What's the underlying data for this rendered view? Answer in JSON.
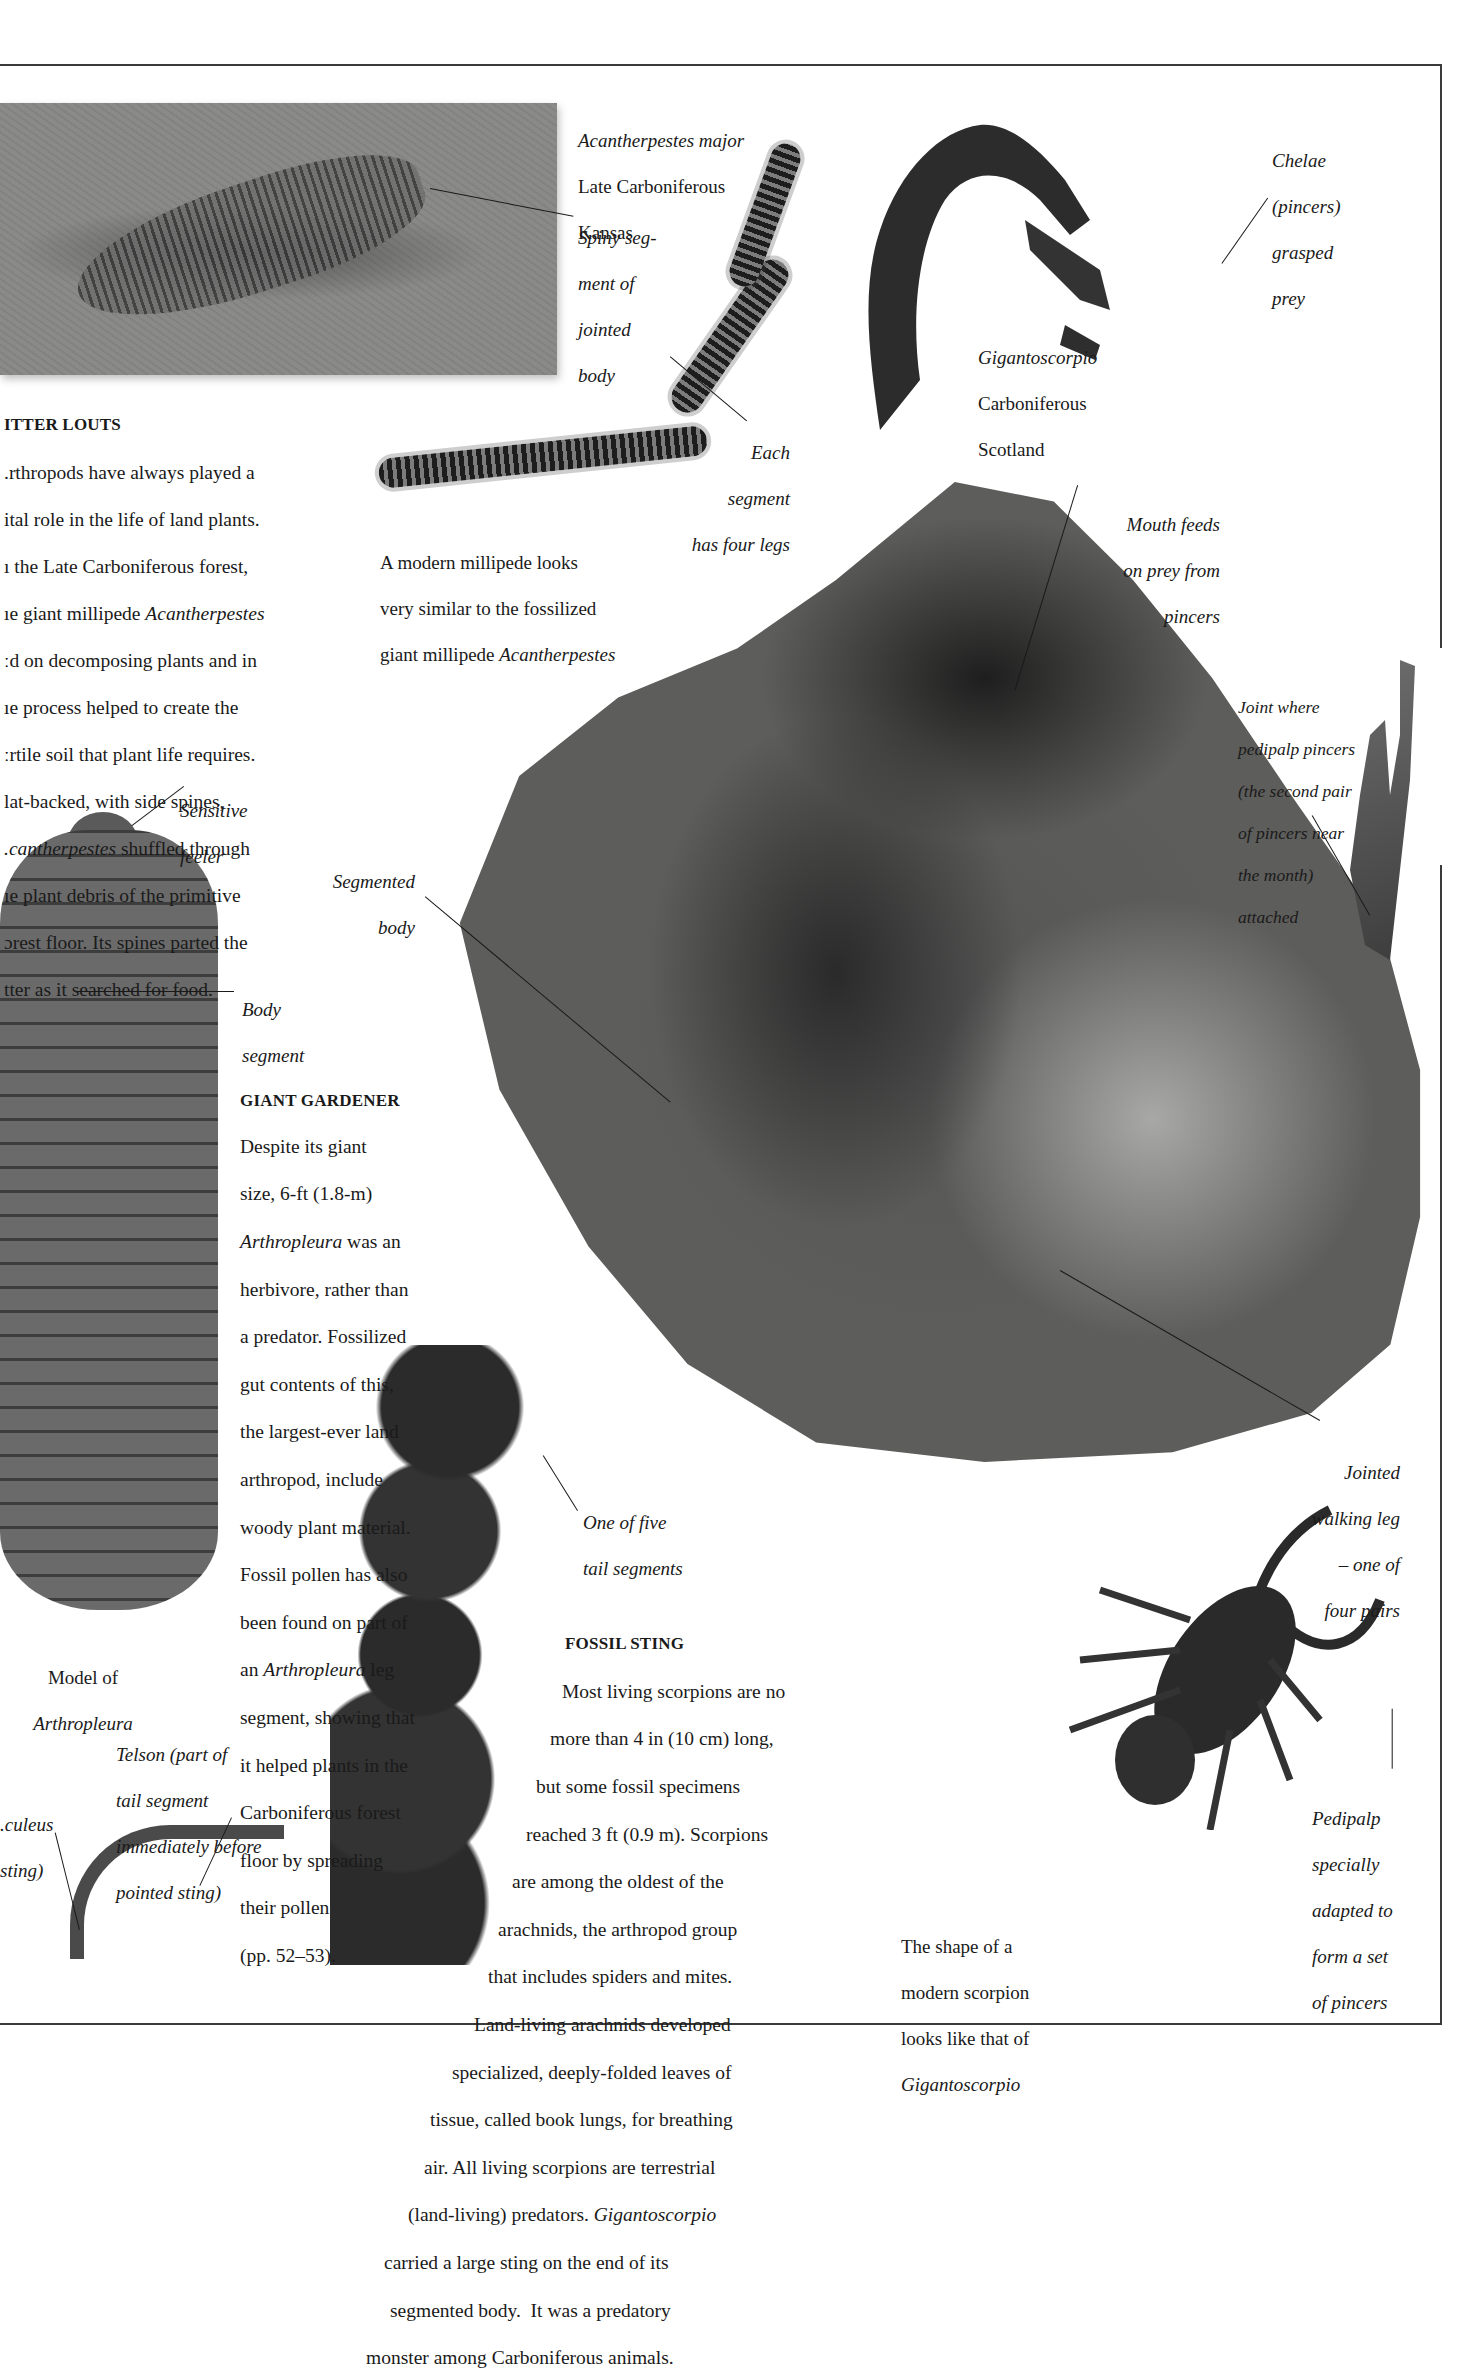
{
  "page": {
    "background": "#ffffff",
    "frame_color": "#3a3a3a"
  },
  "litter_louts": {
    "heading": "ITTER LOUTS",
    "lines": [
      ".rthropods have always played a",
      "ital role in the life of land plants.",
      "ı the Late Carboniferous forest,",
      "ıe giant millipede ",
      "ːd on decomposing plants and in",
      "ıe process helped to create the",
      "ːrtile soil that plant life requires.",
      "lat-backed, with side spines,",
      "",
      "ıe plant debris of the primitive",
      "ɔrest floor. Its spines parted the",
      "tter as it searched for food."
    ],
    "line4_italic": "Acantherpestes",
    "line9_italic": ".cantherpestes",
    "line9_rest": " shuffled through"
  },
  "fossil_millipede_caption": {
    "species": "Acantherpestes major",
    "period": "Late Carboniferous",
    "location": "Kansas"
  },
  "labels": {
    "spiny_segment": [
      "Spiny seg-",
      "ment of",
      "jointed",
      "body"
    ],
    "each_segment": [
      "Each",
      "segment",
      "has four legs"
    ],
    "chelae": [
      "Chelae",
      "(pincers)",
      "grasped",
      "prey"
    ],
    "mouth_feeds": [
      "Mouth feeds",
      "on prey from",
      "pincers"
    ],
    "joint_where": [
      "Joint where",
      "pedipalp pincers",
      "(the second pair",
      "of pincers near",
      "the month)",
      "attached"
    ],
    "sensitive_feeler": [
      "Sensitive",
      "feeler"
    ],
    "segmented_body": [
      "Segmented",
      "body"
    ],
    "body_segment": [
      "Body",
      "segment"
    ],
    "one_of_five": [
      "One of five",
      "tail segments"
    ],
    "jointed_walking_leg": [
      "Jointed",
      "walking leg",
      "– one of",
      "four pairs"
    ],
    "telson": [
      "Telson (part of",
      "tail segment",
      "immediately before",
      "pointed sting)"
    ],
    "aculeus": [
      ".culeus",
      "sting)"
    ],
    "pedipalp": [
      "Pedipalp",
      "specially",
      "adapted to",
      "form a set",
      "of pincers"
    ]
  },
  "scorpion_fossil_caption": {
    "species": "Gigantoscorpio",
    "period": "Carboniferous",
    "location": "Scotland"
  },
  "modern_millipede_caption": {
    "line1": "A modern millipede looks",
    "line2": "very similar to the fossilized",
    "line3_prefix": "giant millipede ",
    "line3_italic": "Acantherpestes"
  },
  "giant_gardener": {
    "heading": "GIANT GARDENER",
    "lines": [
      "Despite its giant",
      "size, 6-ft (1.8-m)",
      "",
      "herbivore, rather than",
      "a predator. Fossilized",
      "gut contents of this,",
      "the largest-ever land",
      "arthropod, include",
      "woody plant material.",
      "Fossil pollen has also",
      "been found on part of",
      "",
      "segment, showing that",
      "it helped plants in the",
      "Carboniferous forest",
      "floor by spreading",
      "their pollen",
      "(pp. 52–53)."
    ],
    "line3_italic": "Arthropleura",
    "line3_rest": " was an",
    "line12_prefix": "an ",
    "line12_italic": "Arthropleura",
    "line12_rest": " leg"
  },
  "arthropleura_caption": {
    "line1": "Model of",
    "line2_italic": "Arthropleura"
  },
  "fossil_sting": {
    "heading": "FOSSIL STING",
    "lines": [
      "Most living scorpions are no",
      "more than 4 in (10 cm) long,",
      "but some fossil specimens",
      "reached 3 ft (0.9 m). Scorpions",
      "are among the oldest of the",
      "arachnids, the arthropod group",
      "that includes spiders and mites.",
      "Land-living arachnids developed",
      "specialized, deeply-folded leaves of",
      "tissue, called book lungs, for breathing",
      "air. All living scorpions are terrestrial",
      "",
      "carried a large sting on the end of its",
      "segmented body.  It was a predatory",
      "monster among Carboniferous animals."
    ],
    "line12_prefix": "(land-living) predators. ",
    "line12_italic": "Gigantoscorpio"
  },
  "modern_scorpion_caption": {
    "line1": "The shape of a",
    "line2": "modern scorpion",
    "line3": "looks like that of",
    "line4_italic": "Gigantoscorpio"
  },
  "specimens": [
    {
      "name": "fossil-slab-acantherpestes"
    },
    {
      "name": "modern-millipede"
    },
    {
      "name": "gigantoscorpio-fragment"
    },
    {
      "name": "gigantoscorpio-main-fossil"
    },
    {
      "name": "pedipalp-pincer-fossil"
    },
    {
      "name": "arthropleura-model"
    },
    {
      "name": "scorpion-tail-fossil"
    },
    {
      "name": "modern-scorpion"
    }
  ]
}
